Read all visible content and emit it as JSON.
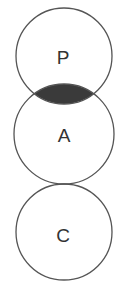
{
  "diagram": {
    "type": "venn-chain",
    "circles": [
      {
        "id": "P",
        "label": "P",
        "cx": 64,
        "cy": 56,
        "r": 48
      },
      {
        "id": "A",
        "label": "A",
        "cx": 64,
        "cy": 134,
        "r": 50
      },
      {
        "id": "C",
        "label": "C",
        "cx": 64,
        "cy": 232,
        "r": 48
      }
    ],
    "shaded_region": {
      "between": [
        "P",
        "A"
      ],
      "color": "#3a3a3a"
    },
    "relations": [
      {
        "from": "P",
        "to": "A",
        "type": "overlap",
        "shaded": true
      },
      {
        "from": "A",
        "to": "C",
        "type": "tangent"
      }
    ]
  }
}
